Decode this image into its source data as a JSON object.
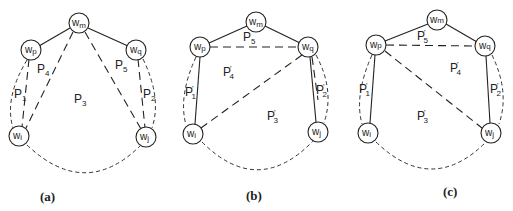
{
  "figure": {
    "panels": [
      {
        "caption": "(a)",
        "nodes": {
          "wm": "w",
          "wp": "w",
          "wq": "w",
          "wi": "w",
          "wj": "w"
        },
        "node_subs": {
          "wm": "m",
          "wp": "p",
          "wq": "q",
          "wi": "i",
          "wj": "j"
        },
        "regions": [
          {
            "base": "P",
            "sub": "4",
            "prime": ""
          },
          {
            "base": "P",
            "sub": "5",
            "prime": ""
          },
          {
            "base": "P",
            "sub": "1",
            "prime": ""
          },
          {
            "base": "P",
            "sub": "3",
            "prime": ""
          },
          {
            "base": "P",
            "sub": "2",
            "prime": ""
          }
        ]
      },
      {
        "caption": "(b)",
        "nodes": {
          "wm": "w",
          "wp": "w",
          "wq": "w",
          "wi": "w",
          "wj": "w"
        },
        "node_subs": {
          "wm": "m",
          "wp": "p",
          "wq": "q",
          "wi": "i",
          "wj": "j"
        },
        "regions": [
          {
            "base": "P",
            "sub": "5",
            "prime": ""
          },
          {
            "base": "P",
            "sub": "4",
            "prime": "'"
          },
          {
            "base": "P",
            "sub": "1",
            "prime": "'"
          },
          {
            "base": "P",
            "sub": "3",
            "prime": "'"
          },
          {
            "base": "P",
            "sub": "2",
            "prime": "'"
          }
        ]
      },
      {
        "caption": "(c)",
        "nodes": {
          "wm": "w",
          "wp": "w",
          "wq": "w",
          "wi": "w",
          "wj": "w"
        },
        "node_subs": {
          "wm": "m",
          "wp": "p",
          "wq": "q",
          "wi": "i",
          "wj": "j"
        },
        "regions": [
          {
            "base": "P",
            "sub": "5",
            "prime": "'"
          },
          {
            "base": "P",
            "sub": "4",
            "prime": "'"
          },
          {
            "base": "P",
            "sub": "1",
            "prime": "'"
          },
          {
            "base": "P",
            "sub": "3",
            "prime": "'"
          },
          {
            "base": "P",
            "sub": "2",
            "prime": "'"
          }
        ]
      }
    ]
  }
}
